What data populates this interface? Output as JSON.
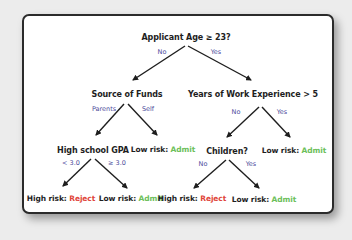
{
  "diagram": {
    "type": "decision-tree",
    "colors": {
      "background": "#ececec",
      "card": "#ffffff",
      "border": "#2b2b2b",
      "node_text": "#1e1e1e",
      "edge_label": "#4a4a9a",
      "reject": "#e0453a",
      "admit": "#6cbf5a"
    },
    "root": {
      "question": "Applicant Age ≥ 23?",
      "edges": {
        "no": "No",
        "yes": "Yes"
      }
    },
    "left": {
      "question": "Source of Funds",
      "edges": {
        "parents": "Parents",
        "self": "Self"
      },
      "gpa": {
        "question": "High school GPA",
        "edges": {
          "low": "< 3.0",
          "high": "≥ 3.0"
        },
        "low_leaf": {
          "prefix": "High risk: ",
          "decision": "Reject"
        },
        "high_leaf": {
          "prefix": "Low risk: ",
          "decision": "Admit"
        }
      },
      "self_leaf": {
        "prefix": "Low risk: ",
        "decision": "Admit"
      }
    },
    "right": {
      "question": "Years of Work Experience > 5",
      "edges": {
        "no": "No",
        "yes": "Yes"
      },
      "children": {
        "question": "Children?",
        "edges": {
          "no": "No",
          "yes": "Yes"
        },
        "no_leaf": {
          "prefix": "High risk: ",
          "decision": "Reject"
        },
        "yes_leaf": {
          "prefix": "Low risk: ",
          "decision": "Admit"
        }
      },
      "yes_leaf": {
        "prefix": "Low risk: ",
        "decision": "Admit"
      }
    }
  }
}
